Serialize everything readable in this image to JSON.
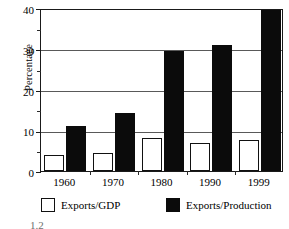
{
  "chart_data": {
    "type": "bar",
    "title": "",
    "xlabel": "",
    "ylabel": "Percentage",
    "categories": [
      "1960",
      "1970",
      "1980",
      "1990",
      "1999"
    ],
    "series": [
      {
        "name": "Exports/GDP",
        "color": "#ffffff",
        "edge_color": "#111111",
        "values": [
          3.9,
          4.3,
          8.2,
          6.9,
          7.6
        ]
      },
      {
        "name": "Exports/Production",
        "color": "#0b0b0b",
        "edge_color": "#0b0b0b",
        "values": [
          11.1,
          14.3,
          29.4,
          31.0,
          39.5
        ]
      }
    ],
    "ylim": [
      0,
      40
    ],
    "ytick_labels": [
      "0",
      "10",
      "20",
      "30",
      "40"
    ],
    "ytick_values": [
      0,
      10,
      20,
      30,
      40
    ],
    "yminor_values": [
      5,
      15,
      25,
      35
    ],
    "grid": "horizontal-major",
    "legend_position": "below-axes",
    "axis_color": "#1a1a1a",
    "grid_color": "#595959",
    "background": "#ffffff"
  },
  "legend": {
    "entries": [
      {
        "label": "Exports/GDP",
        "swatch": "white-square-swatch"
      },
      {
        "label": "Exports/Production",
        "swatch": "black-square-swatch"
      }
    ]
  },
  "caption": {
    "remnant": "1.2"
  }
}
